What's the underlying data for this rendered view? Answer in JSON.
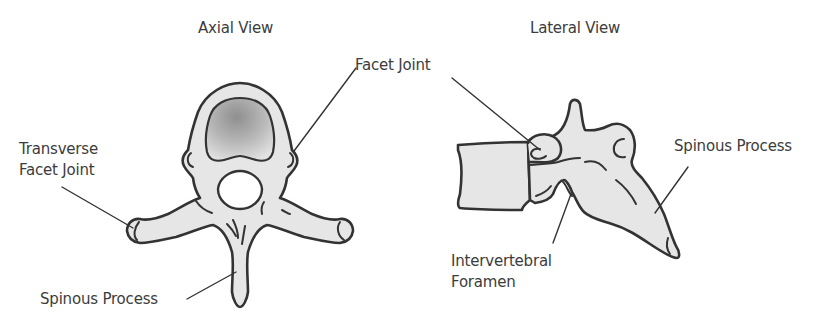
{
  "diagram": {
    "views": [
      {
        "title": "Axial View",
        "labels": {
          "transverse_line1": "Transverse",
          "transverse_line2": "Facet Joint",
          "spinous": "Spinous Process"
        }
      },
      {
        "title": "Lateral View",
        "labels": {
          "spinous": "Spinous Process",
          "intervertebral_line1": "Intervertebral",
          "intervertebral_line2": "Foramen"
        }
      }
    ],
    "shared_labels": {
      "facet_joint": "Facet Joint"
    },
    "colors": {
      "bone_fill": "#e6e6e6",
      "body_gradient_dark": "#9a9a9a",
      "outline": "#333333",
      "text": "#3c3c3c",
      "background": "#ffffff"
    }
  }
}
